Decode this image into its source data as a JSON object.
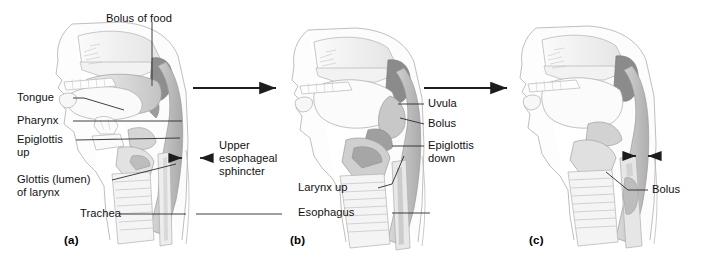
{
  "figure": {
    "background_color": "#ffffff",
    "line_color": "#2b2b2b",
    "text_color": "#111111"
  },
  "panels": [
    {
      "tag": "(a)",
      "name": "panel-a",
      "stage": "Oral / voluntary phase - bolus in mouth, epiglottis up, upper esophageal sphincter closed",
      "labels": [
        {
          "key": "bolus_of_food",
          "text": "Bolus of food"
        },
        {
          "key": "tongue",
          "text": "Tongue"
        },
        {
          "key": "pharynx",
          "text": "Pharynx"
        },
        {
          "key": "epiglottis_up_line1",
          "text": "Epiglottis"
        },
        {
          "key": "epiglottis_up_line2",
          "text": "up"
        },
        {
          "key": "glottis_line1",
          "text": "Glottis (lumen)"
        },
        {
          "key": "glottis_line2",
          "text": "of larynx"
        },
        {
          "key": "trachea",
          "text": "Trachea"
        }
      ]
    },
    {
      "tag": "(b)",
      "name": "panel-b",
      "stage": "Pharyngeal phase - larynx up, epiglottis down, bolus entering pharynx",
      "labels": [
        {
          "key": "uvula",
          "text": "Uvula"
        },
        {
          "key": "bolus",
          "text": "Bolus"
        },
        {
          "key": "epiglottis_down_line1",
          "text": "Epiglottis"
        },
        {
          "key": "epiglottis_down_line2",
          "text": "down"
        },
        {
          "key": "larynx_up",
          "text": "Larynx up"
        },
        {
          "key": "esophagus",
          "text": "Esophagus"
        }
      ]
    },
    {
      "tag": "(c)",
      "name": "panel-c",
      "stage": "Esophageal phase - bolus in esophagus, sphincter contracting behind it",
      "labels": [
        {
          "key": "bolus",
          "text": "Bolus"
        }
      ]
    }
  ],
  "shared_labels": {
    "upper_esophageal_sphincter_line1": "Upper",
    "upper_esophageal_sphincter_line2": "esophageal",
    "upper_esophageal_sphincter_line3": "sphincter"
  },
  "transition_arrows": [
    {
      "key": "arrow-a-to-b",
      "from": "(a)",
      "to": "(b)"
    },
    {
      "key": "arrow-b-to-c",
      "from": "(b)",
      "to": "(c)"
    }
  ],
  "sphincter_markers": [
    {
      "key": "sphincter-arrows-a",
      "panel": "(a)",
      "meaning": "opposed arrows indicating closed upper esophageal sphincter"
    },
    {
      "key": "sphincter-arrows-c",
      "panel": "(c)",
      "meaning": "opposed arrows indicating sphincter contracting above bolus"
    }
  ]
}
